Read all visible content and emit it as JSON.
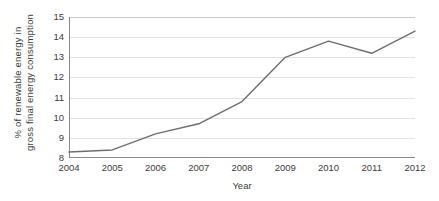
{
  "chart_data": {
    "type": "line",
    "title": "",
    "subtitle": "",
    "xlabel": "Year",
    "ylabel": "% of renewable energy in gross final energy consumption",
    "ylabel_lines": [
      "% of renewable energy in",
      "gross final energy consumption"
    ],
    "categories": [
      "2004",
      "2005",
      "2006",
      "2007",
      "2008",
      "2009",
      "2010",
      "2011",
      "2012"
    ],
    "x": [
      2004,
      2005,
      2006,
      2007,
      2008,
      2009,
      2010,
      2011,
      2012
    ],
    "values": [
      8.3,
      8.4,
      9.2,
      9.7,
      10.8,
      13.0,
      13.8,
      13.2,
      14.3
    ],
    "series": [
      {
        "name": "% of renewable energy in gross final energy consumption",
        "values": [
          8.3,
          8.4,
          9.2,
          9.7,
          10.8,
          13.0,
          13.8,
          13.2,
          14.3
        ]
      }
    ],
    "ylim": [
      8,
      15
    ],
    "xlim": [
      2004,
      2012
    ],
    "yticks": [
      8,
      9,
      10,
      11,
      12,
      13,
      14,
      15
    ],
    "ytick_labels": [
      "8",
      "9",
      "10",
      "11",
      "12",
      "13",
      "14",
      "15"
    ],
    "xticks": [
      2004,
      2005,
      2006,
      2007,
      2008,
      2009,
      2010,
      2011,
      2012
    ],
    "xtick_labels": [
      "2004",
      "2005",
      "2006",
      "2007",
      "2008",
      "2009",
      "2010",
      "2011",
      "2012"
    ],
    "grid": true,
    "grid_axis": "y",
    "legend": false,
    "legend_position": "none",
    "markers": false,
    "annotations": []
  },
  "style": {
    "line_color": "#6e6e6e",
    "line_width": 1.4,
    "grid_color": "#e3e3e3",
    "axis_color": "#8a8a8a",
    "text_color": "#3c3c3c",
    "background": "#ffffff"
  }
}
